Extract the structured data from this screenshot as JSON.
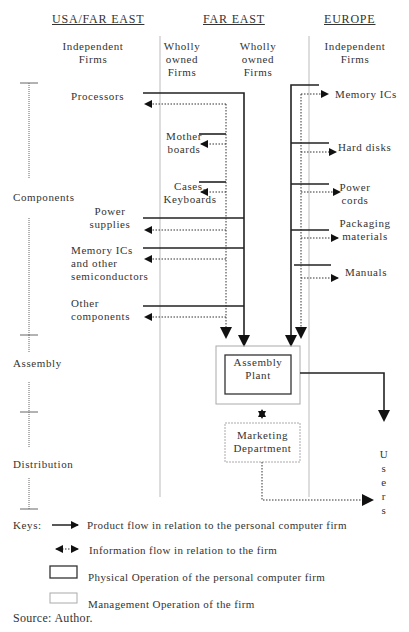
{
  "headers": {
    "usa_far_east": "USA/FAR EAST",
    "far_east": "FAR EAST",
    "europe": "EUROPE"
  },
  "subheaders": {
    "usa_independent": [
      "Independent",
      "Firms"
    ],
    "fe_wholly_left": [
      "Wholly",
      "owned",
      "Firms"
    ],
    "fe_wholly_right": [
      "Wholly",
      "owned",
      "Firms"
    ],
    "eu_independent": [
      "Independent",
      "Firms"
    ]
  },
  "stages": {
    "components": "Components",
    "assembly": "Assembly",
    "distribution": "Distribution"
  },
  "usa_suppliers": {
    "processors": "Processors",
    "power_supplies": [
      "Power",
      "supplies"
    ],
    "memory_ics": [
      "Memory ICs",
      "and other",
      "semiconductors"
    ],
    "other_components": [
      "Other",
      "components"
    ]
  },
  "far_east_suppliers": {
    "motherboards": [
      "Mother",
      "boards"
    ],
    "cases_keyboards": [
      "Cases,",
      "Keyboards"
    ]
  },
  "europe_suppliers": {
    "memory_ics": "Memory ICs",
    "hard_disks": "Hard disks",
    "power_cords": [
      "Power",
      "cords"
    ],
    "packaging": [
      "Packaging",
      "materials"
    ],
    "manuals": "Manuals"
  },
  "boxes": {
    "assembly_plant": [
      "Assembly",
      "Plant"
    ],
    "marketing": [
      "Marketing",
      "Department"
    ]
  },
  "users": [
    "U",
    "s",
    "e",
    "r",
    "s"
  ],
  "keys": {
    "label": "Keys:",
    "product_flow": "Product flow in relation to the personal computer firm",
    "information_flow": "Information flow in relation to the firm",
    "physical_operation": "Physical Operation of the personal computer firm",
    "management_operation": "Management Operation of the firm"
  },
  "source": "Source: Author."
}
